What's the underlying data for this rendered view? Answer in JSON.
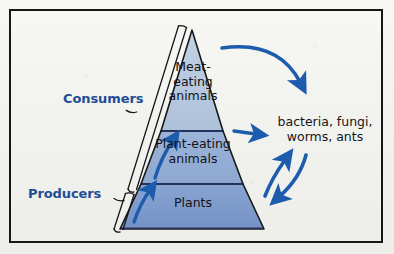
{
  "diagram": {
    "colors": {
      "label_blue": "#1f4e96",
      "arrow_blue": "#1d5cad",
      "outline": "#17171a",
      "tier_top": "#b9cbe0",
      "tier_middle": "#95afd4",
      "tier_bottom": "#7f9ccd",
      "divider": "#22325a",
      "frame": "#17171a",
      "background": "#f4f4f1"
    },
    "tiers": [
      {
        "id": "top",
        "label": "Meat-\neating\nanimals",
        "level": 3
      },
      {
        "id": "middle",
        "label": "Plant-eating\nanimals",
        "level": 2
      },
      {
        "id": "bottom",
        "label": "Plants",
        "level": 1
      }
    ],
    "brace_labels": [
      {
        "id": "consumers",
        "label": "Consumers",
        "covers": [
          "top",
          "middle"
        ]
      },
      {
        "id": "producers",
        "label": "Producers",
        "covers": [
          "bottom"
        ]
      }
    ],
    "decomposers": {
      "heading": "Decomposers",
      "organisms": "bacteria, fungi,\nworms, ants"
    },
    "arrows": [
      {
        "id": "energy-flow-lower",
        "kind": "up-arrow",
        "from": "bottom",
        "to": "middle"
      },
      {
        "id": "energy-flow-upper",
        "kind": "up-arrow",
        "from": "middle",
        "to": "top"
      },
      {
        "id": "top-to-decomposers",
        "kind": "curved-arrow",
        "from": "top",
        "to": "decomposers"
      },
      {
        "id": "middle-to-decomposers",
        "kind": "short-arrow",
        "from": "middle",
        "to": "decomposers"
      },
      {
        "id": "bottom-to-decomposers",
        "kind": "curved-arrow",
        "from": "bottom",
        "to": "decomposers"
      },
      {
        "id": "decomposers-to-pyramid",
        "kind": "curved-arrow",
        "from": "decomposers",
        "to": "bottom"
      }
    ]
  }
}
